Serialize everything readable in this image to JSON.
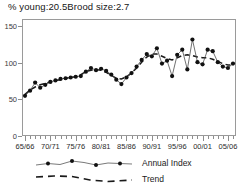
{
  "header": {
    "percent_young_label": "% young:",
    "percent_young_value": "20.5",
    "brood_size_label": "Brood size:",
    "brood_size_value": "2.7"
  },
  "legend": {
    "annual_index": "Annual Index",
    "trend": "Trend"
  },
  "colors": {
    "line": "#4d4d4d",
    "marker": "#111111",
    "trend": "#1a1a1a",
    "axis": "#9a9a9a",
    "text": "#1a1a1a"
  },
  "chart_data": {
    "type": "line",
    "xlabel": "",
    "ylabel": "",
    "ylim": [
      0,
      160
    ],
    "yticks": [
      0,
      50,
      100,
      150
    ],
    "ytick_labels": [
      "0",
      "50",
      "100",
      "150"
    ],
    "xlim": [
      1965,
      2006
    ],
    "xtick_positions": [
      1965,
      1970,
      1975,
      1980,
      1985,
      1990,
      1995,
      2000,
      2005
    ],
    "xtick_labels": [
      "65/66",
      "70/71",
      "75/76",
      "80/81",
      "85/86",
      "90/91",
      "95/96",
      "00/01",
      "05/06"
    ],
    "grid": false,
    "legend_position": "below-plot-left",
    "x": [
      1965,
      1966,
      1967,
      1968,
      1969,
      1970,
      1971,
      1972,
      1973,
      1974,
      1975,
      1976,
      1977,
      1978,
      1979,
      1980,
      1981,
      1982,
      1983,
      1984,
      1985,
      1986,
      1987,
      1988,
      1989,
      1990,
      1991,
      1992,
      1993,
      1994,
      1995,
      1996,
      1997,
      1998,
      1999,
      2000,
      2001,
      2002,
      2003,
      2004,
      2005,
      2006
    ],
    "series": [
      {
        "name": "Annual Index",
        "style": "line-markers",
        "values": [
          55,
          62,
          73,
          66,
          70,
          74,
          76,
          78,
          79,
          80,
          81,
          82,
          88,
          93,
          90,
          92,
          89,
          84,
          77,
          71,
          80,
          86,
          95,
          104,
          112,
          109,
          120,
          99,
          103,
          82,
          111,
          118,
          91,
          132,
          101,
          98,
          118,
          116,
          101,
          95,
          93,
          99
        ]
      },
      {
        "name": "Trend",
        "style": "dashed",
        "values": [
          57,
          63,
          67,
          70,
          72,
          74,
          76,
          77,
          79,
          80,
          81,
          84,
          88,
          90,
          91,
          90,
          87,
          83,
          79,
          78,
          81,
          86,
          93,
          101,
          108,
          112,
          112,
          109,
          106,
          104,
          107,
          110,
          111,
          110,
          108,
          107,
          107,
          105,
          102,
          99,
          97,
          97
        ]
      }
    ]
  }
}
